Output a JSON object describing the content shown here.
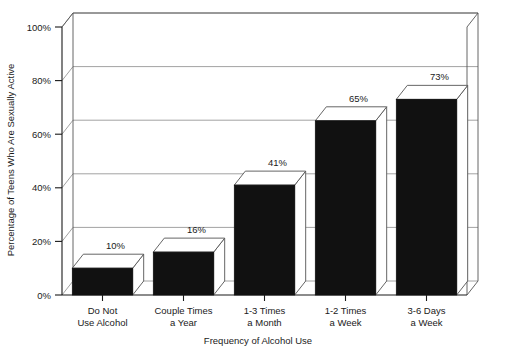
{
  "chart_data": {
    "type": "bar",
    "title": "",
    "subtitle": "",
    "categories": [
      "Do Not\nUse Alcohol",
      "Couple Times\na Year",
      "1-3 Times\na Month",
      "1-2 Times\na Week",
      "3-6 Days\na Week"
    ],
    "category_lines": [
      [
        "Do Not",
        "Use Alcohol"
      ],
      [
        "Couple Times",
        "a Year"
      ],
      [
        "1-3 Times",
        "a Month"
      ],
      [
        "1-2 Times",
        "a Week"
      ],
      [
        "3-6 Days",
        "a Week"
      ]
    ],
    "values": [
      10,
      16,
      41,
      65,
      73
    ],
    "value_labels": [
      "10%",
      "16%",
      "41%",
      "65%",
      "73%"
    ],
    "xlabel": "Frequency of Alcohol Use",
    "ylabel": "Percentage of Teens Who Are Sexually Active",
    "ylim": [
      0,
      100
    ],
    "yticks": [
      0,
      20,
      40,
      60,
      80,
      100
    ],
    "ytick_labels": [
      "0%",
      "20%",
      "40%",
      "60%",
      "80%",
      "100%"
    ],
    "grid": true,
    "legend": null,
    "style": "3d-column",
    "colors": {
      "bar_front": "#111111",
      "bar_top": "#ffffff",
      "bar_side": "#ffffff",
      "grid": "#8a8a8a",
      "axis": "#1a1a1a",
      "background": "#ffffff"
    }
  },
  "axes": {
    "y_title": "Percentage of Teens Who Are Sexually Active",
    "x_title": "Frequency of Alcohol Use"
  }
}
